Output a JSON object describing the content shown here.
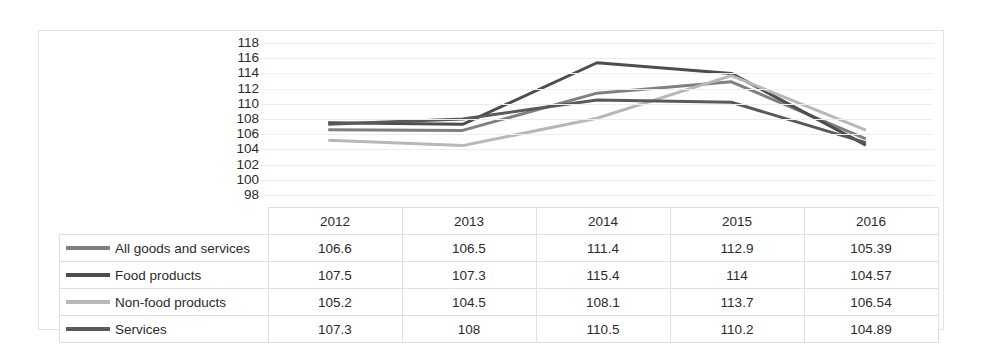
{
  "chart_data": {
    "type": "line",
    "title": "",
    "xlabel": "",
    "ylabel": "",
    "categories": [
      "2012",
      "2013",
      "2014",
      "2015",
      "2016"
    ],
    "ylim": [
      98,
      118
    ],
    "yticks": [
      118,
      116,
      114,
      112,
      110,
      108,
      106,
      104,
      102,
      100,
      98
    ],
    "grid": true,
    "legend_position": "table-left",
    "series": [
      {
        "name": "All goods and services",
        "color": "#808080",
        "values": [
          106.6,
          106.5,
          111.4,
          112.9,
          105.39
        ],
        "display_values": [
          "106.6",
          "106.5",
          "111.4",
          "112.9",
          "105.39"
        ]
      },
      {
        "name": "Food products",
        "color": "#4d4d4d",
        "values": [
          107.5,
          107.3,
          115.4,
          114,
          104.57
        ],
        "display_values": [
          "107.5",
          "107.3",
          "115.4",
          "114",
          "104.57"
        ]
      },
      {
        "name": "Non-food products",
        "color": "#b8b8b8",
        "values": [
          105.2,
          104.5,
          108.1,
          113.7,
          106.54
        ],
        "display_values": [
          "105.2",
          "104.5",
          "108.1",
          "113.7",
          "106.54"
        ]
      },
      {
        "name": "Services",
        "color": "#5a5a5a",
        "values": [
          107.3,
          108,
          110.5,
          110.2,
          104.89
        ],
        "display_values": [
          "107.3",
          "108",
          "110.5",
          "110.2",
          "104.89"
        ]
      }
    ]
  },
  "table": {
    "corner_label": "",
    "year_headers": [
      "2012",
      "2013",
      "2014",
      "2015",
      "2016"
    ],
    "rows": [
      {
        "label": "All goods and services",
        "color": "#808080",
        "cells": [
          "106.6",
          "106.5",
          "111.4",
          "112.9",
          "105.39"
        ]
      },
      {
        "label": "Food products",
        "color": "#4d4d4d",
        "cells": [
          "107.5",
          "107.3",
          "115.4",
          "114",
          "104.57"
        ]
      },
      {
        "label": "Non-food products",
        "color": "#b8b8b8",
        "cells": [
          "105.2",
          "104.5",
          "108.1",
          "113.7",
          "106.54"
        ]
      },
      {
        "label": "Services",
        "color": "#5a5a5a",
        "cells": [
          "107.3",
          "108",
          "110.5",
          "110.2",
          "104.89"
        ]
      }
    ]
  },
  "axis": {
    "y_tick_labels": [
      "118",
      "116",
      "114",
      "112",
      "110",
      "108",
      "106",
      "104",
      "102",
      "100",
      "98"
    ]
  }
}
